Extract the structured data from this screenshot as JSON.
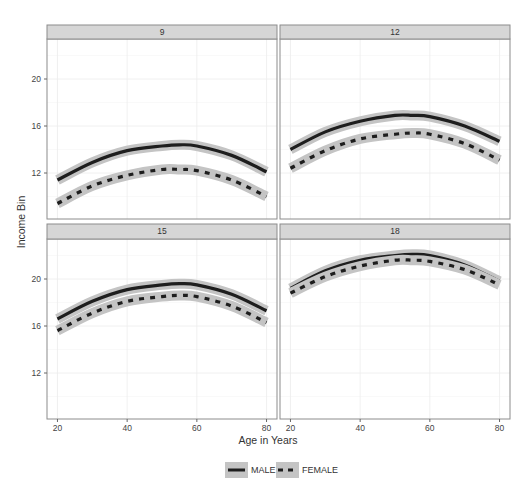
{
  "chart_data": {
    "type": "line",
    "title": "",
    "xlabel": "Age in Years",
    "ylabel": "Income Bin",
    "facet_by": "strip",
    "xlim": [
      17,
      83
    ],
    "ylim": [
      8,
      23.3
    ],
    "x_ticks": [
      20,
      40,
      60,
      80
    ],
    "y_ticks": [
      12,
      16,
      20
    ],
    "grid": true,
    "legend_position": "bottom",
    "legend": [
      {
        "name": "MALE",
        "style": "solid"
      },
      {
        "name": "FEMALE",
        "style": "dashed"
      }
    ],
    "x": [
      20,
      30,
      40,
      50,
      55,
      60,
      70,
      80
    ],
    "panels": [
      {
        "strip": "9",
        "series": [
          {
            "name": "MALE",
            "values": [
              11.4,
              12.9,
              13.9,
              14.3,
              14.4,
              14.3,
              13.5,
              12.1
            ]
          },
          {
            "name": "FEMALE",
            "values": [
              9.4,
              10.9,
              11.8,
              12.3,
              12.3,
              12.2,
              11.4,
              10.0
            ]
          }
        ]
      },
      {
        "strip": "12",
        "series": [
          {
            "name": "MALE",
            "values": [
              14.0,
              15.5,
              16.4,
              16.9,
              16.9,
              16.8,
              16.0,
              14.7
            ]
          },
          {
            "name": "FEMALE",
            "values": [
              12.4,
              13.9,
              14.9,
              15.3,
              15.4,
              15.3,
              14.5,
              13.1
            ]
          }
        ]
      },
      {
        "strip": "15",
        "series": [
          {
            "name": "MALE",
            "values": [
              16.6,
              18.1,
              19.1,
              19.5,
              19.6,
              19.5,
              18.7,
              17.3
            ]
          },
          {
            "name": "FEMALE",
            "values": [
              15.6,
              17.1,
              18.1,
              18.5,
              18.6,
              18.5,
              17.7,
              16.3
            ]
          }
        ]
      },
      {
        "strip": "18",
        "series": [
          {
            "name": "MALE",
            "values": [
              19.2,
              20.7,
              21.6,
              22.0,
              22.1,
              22.0,
              21.2,
              19.8
            ]
          },
          {
            "name": "FEMALE",
            "values": [
              18.8,
              20.2,
              21.1,
              21.6,
              21.6,
              21.5,
              20.8,
              19.5
            ]
          }
        ]
      }
    ]
  },
  "labels": {
    "xlabel": "Age in Years",
    "ylabel": "Income Bin",
    "legend_male": "MALE",
    "legend_female": "FEMALE"
  },
  "colors": {
    "strip_bg": "#d6d6d6",
    "panel_border": "#8c8c8c",
    "ribbon": "#c4c4c4",
    "line": "#1e1e1e",
    "grid": "#ececec"
  }
}
